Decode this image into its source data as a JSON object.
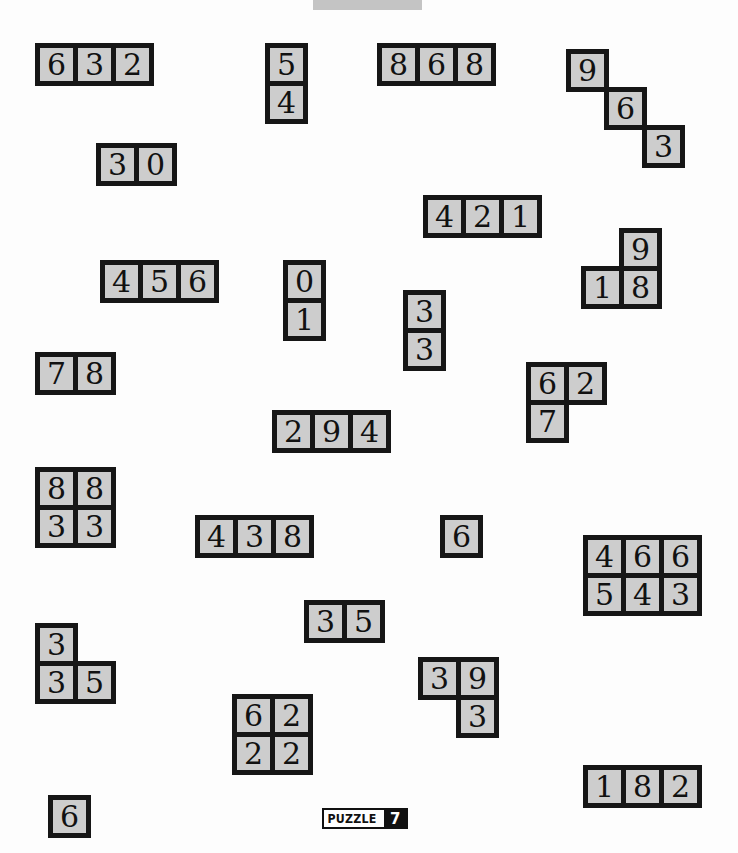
{
  "puzzle": {
    "label": "PUZZLE",
    "number": "7"
  },
  "cell_size": 38,
  "colors": {
    "cell_fill": "#cdcdcd",
    "border": "#161616",
    "background": "#fdfdfd"
  },
  "pieces": [
    {
      "id": "p1",
      "x": 35,
      "y": 43,
      "cells": [
        {
          "r": 0,
          "c": 0,
          "v": "6"
        },
        {
          "r": 0,
          "c": 1,
          "v": "3"
        },
        {
          "r": 0,
          "c": 2,
          "v": "2"
        }
      ]
    },
    {
      "id": "p2",
      "x": 265,
      "y": 43,
      "cells": [
        {
          "r": 0,
          "c": 0,
          "v": "5"
        },
        {
          "r": 1,
          "c": 0,
          "v": "4"
        }
      ]
    },
    {
      "id": "p3",
      "x": 377,
      "y": 43,
      "cells": [
        {
          "r": 0,
          "c": 0,
          "v": "8"
        },
        {
          "r": 0,
          "c": 1,
          "v": "6"
        },
        {
          "r": 0,
          "c": 2,
          "v": "8"
        }
      ]
    },
    {
      "id": "p4",
      "x": 566,
      "y": 49,
      "cells": [
        {
          "r": 0,
          "c": 0,
          "v": "9"
        },
        {
          "r": 1,
          "c": 1,
          "v": "6"
        },
        {
          "r": 2,
          "c": 2,
          "v": "3"
        }
      ]
    },
    {
      "id": "p5",
      "x": 96,
      "y": 143,
      "cells": [
        {
          "r": 0,
          "c": 0,
          "v": "3"
        },
        {
          "r": 0,
          "c": 1,
          "v": "0"
        }
      ]
    },
    {
      "id": "p6",
      "x": 423,
      "y": 195,
      "cells": [
        {
          "r": 0,
          "c": 0,
          "v": "4"
        },
        {
          "r": 0,
          "c": 1,
          "v": "2"
        },
        {
          "r": 0,
          "c": 2,
          "v": "1"
        }
      ]
    },
    {
      "id": "p7",
      "x": 581,
      "y": 228,
      "cells": [
        {
          "r": 0,
          "c": 1,
          "v": "9"
        },
        {
          "r": 1,
          "c": 0,
          "v": "1"
        },
        {
          "r": 1,
          "c": 1,
          "v": "8"
        }
      ]
    },
    {
      "id": "p8",
      "x": 100,
      "y": 260,
      "cells": [
        {
          "r": 0,
          "c": 0,
          "v": "4"
        },
        {
          "r": 0,
          "c": 1,
          "v": "5"
        },
        {
          "r": 0,
          "c": 2,
          "v": "6"
        }
      ]
    },
    {
      "id": "p9",
      "x": 283,
      "y": 260,
      "cells": [
        {
          "r": 0,
          "c": 0,
          "v": "0"
        },
        {
          "r": 1,
          "c": 0,
          "v": "1"
        }
      ]
    },
    {
      "id": "p10",
      "x": 403,
      "y": 290,
      "cells": [
        {
          "r": 0,
          "c": 0,
          "v": "3"
        },
        {
          "r": 1,
          "c": 0,
          "v": "3"
        }
      ]
    },
    {
      "id": "p11",
      "x": 35,
      "y": 352,
      "cells": [
        {
          "r": 0,
          "c": 0,
          "v": "7"
        },
        {
          "r": 0,
          "c": 1,
          "v": "8"
        }
      ]
    },
    {
      "id": "p12",
      "x": 526,
      "y": 362,
      "cells": [
        {
          "r": 0,
          "c": 0,
          "v": "6"
        },
        {
          "r": 0,
          "c": 1,
          "v": "2"
        },
        {
          "r": 1,
          "c": 0,
          "v": "7"
        }
      ]
    },
    {
      "id": "p13",
      "x": 272,
      "y": 410,
      "cells": [
        {
          "r": 0,
          "c": 0,
          "v": "2"
        },
        {
          "r": 0,
          "c": 1,
          "v": "9"
        },
        {
          "r": 0,
          "c": 2,
          "v": "4"
        }
      ]
    },
    {
      "id": "p14",
      "x": 35,
      "y": 467,
      "cells": [
        {
          "r": 0,
          "c": 0,
          "v": "8"
        },
        {
          "r": 0,
          "c": 1,
          "v": "8"
        },
        {
          "r": 1,
          "c": 0,
          "v": "3"
        },
        {
          "r": 1,
          "c": 1,
          "v": "3"
        }
      ]
    },
    {
      "id": "p15",
      "x": 195,
      "y": 515,
      "cells": [
        {
          "r": 0,
          "c": 0,
          "v": "4"
        },
        {
          "r": 0,
          "c": 1,
          "v": "3"
        },
        {
          "r": 0,
          "c": 2,
          "v": "8"
        }
      ]
    },
    {
      "id": "p16",
      "x": 440,
      "y": 515,
      "cells": [
        {
          "r": 0,
          "c": 0,
          "v": "6"
        }
      ]
    },
    {
      "id": "p17",
      "x": 583,
      "y": 535,
      "cells": [
        {
          "r": 0,
          "c": 0,
          "v": "4"
        },
        {
          "r": 0,
          "c": 1,
          "v": "6"
        },
        {
          "r": 0,
          "c": 2,
          "v": "6"
        },
        {
          "r": 1,
          "c": 0,
          "v": "5"
        },
        {
          "r": 1,
          "c": 1,
          "v": "4"
        },
        {
          "r": 1,
          "c": 2,
          "v": "3"
        }
      ]
    },
    {
      "id": "p18",
      "x": 304,
      "y": 600,
      "cells": [
        {
          "r": 0,
          "c": 0,
          "v": "3"
        },
        {
          "r": 0,
          "c": 1,
          "v": "5"
        }
      ]
    },
    {
      "id": "p19",
      "x": 35,
      "y": 623,
      "cells": [
        {
          "r": 0,
          "c": 0,
          "v": "3"
        },
        {
          "r": 1,
          "c": 0,
          "v": "3"
        },
        {
          "r": 1,
          "c": 1,
          "v": "5"
        }
      ]
    },
    {
      "id": "p20",
      "x": 418,
      "y": 657,
      "cells": [
        {
          "r": 0,
          "c": 0,
          "v": "3"
        },
        {
          "r": 0,
          "c": 1,
          "v": "9"
        },
        {
          "r": 1,
          "c": 1,
          "v": "3"
        }
      ]
    },
    {
      "id": "p21",
      "x": 232,
      "y": 694,
      "cells": [
        {
          "r": 0,
          "c": 0,
          "v": "6"
        },
        {
          "r": 0,
          "c": 1,
          "v": "2"
        },
        {
          "r": 1,
          "c": 0,
          "v": "2"
        },
        {
          "r": 1,
          "c": 1,
          "v": "2"
        }
      ]
    },
    {
      "id": "p22",
      "x": 583,
      "y": 765,
      "cells": [
        {
          "r": 0,
          "c": 0,
          "v": "1"
        },
        {
          "r": 0,
          "c": 1,
          "v": "8"
        },
        {
          "r": 0,
          "c": 2,
          "v": "2"
        }
      ]
    },
    {
      "id": "p23",
      "x": 48,
      "y": 795,
      "cells": [
        {
          "r": 0,
          "c": 0,
          "v": "6"
        }
      ]
    }
  ]
}
